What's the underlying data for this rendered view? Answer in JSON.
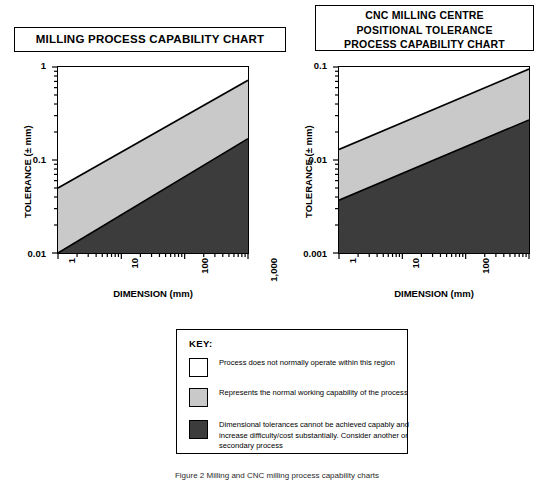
{
  "page": {
    "width": 544,
    "height": 482,
    "background": "#ffffff"
  },
  "colors": {
    "white_band": "#ffffff",
    "light_gray_band": "#c9c9c9",
    "dark_gray_band": "#3c3c3c",
    "line": "#000000"
  },
  "charts": [
    {
      "id": "milling-process-capability",
      "title_lines": [
        "MILLING PROCESS CAPABILITY CHART"
      ],
      "xlabel": "DIMENSION (mm)",
      "ylabel": "TOLERANCE (± mm)",
      "xticks": [
        "1",
        "10",
        "100",
        "1,000"
      ],
      "yticks": [
        "0.01",
        "0.1",
        "1"
      ]
    },
    {
      "id": "cnc-positional-tolerance",
      "title_lines": [
        "CNC MILLING CENTRE",
        "POSITIONAL TOLERANCE",
        "PROCESS CAPABILITY CHART"
      ],
      "xlabel": "DIMENSION (mm)",
      "ylabel": "TOLERANCE (± mm)",
      "xticks": [
        "1",
        "10",
        "100",
        "1,000"
      ],
      "yticks": [
        "0.001",
        "0.01",
        "0.1"
      ]
    }
  ],
  "key": {
    "title": "KEY:",
    "items": [
      {
        "swatch": "white",
        "color": "#ffffff",
        "text": "Process does not normally operate within this region"
      },
      {
        "swatch": "light-gray",
        "color": "#c9c9c9",
        "text": "Represents the normal working capability of the process"
      },
      {
        "swatch": "dark-gray",
        "color": "#3c3c3c",
        "text": "Dimensional tolerances cannot be achieved capably and increase difficulty/cost substantially. Consider another or secondary process"
      }
    ]
  },
  "caption": "Figure 2 Milling and CNC milling process capability charts",
  "chart_data": [
    {
      "type": "area",
      "id": "milling-process-capability",
      "title": "MILLING PROCESS CAPABILITY CHART",
      "xlabel": "DIMENSION (mm)",
      "ylabel": "TOLERANCE (± mm)",
      "xscale": "log",
      "yscale": "log",
      "xlim": [
        1,
        1000
      ],
      "ylim": [
        0.01,
        1
      ],
      "xticks": [
        1,
        10,
        100,
        1000
      ],
      "xticklabels": [
        "1",
        "10",
        "100",
        "1,000"
      ],
      "yticks": [
        0.01,
        0.1,
        1
      ],
      "yticklabels": [
        "0.01",
        "0.1",
        "1"
      ],
      "grid": false,
      "legend": "below, in KEY box",
      "series": [
        {
          "name": "upper boundary (white / normal-capability divide)",
          "x": [
            1,
            1000
          ],
          "y": [
            0.05,
            0.72
          ]
        },
        {
          "name": "lower boundary (normal-capability / not-capable divide)",
          "x": [
            1,
            1000
          ],
          "y": [
            0.01,
            0.17
          ]
        }
      ],
      "bands": [
        {
          "name": "Process does not normally operate within this region",
          "fill": "#ffffff",
          "region": "above upper boundary"
        },
        {
          "name": "Represents the normal working capability of the process",
          "fill": "#c9c9c9",
          "region": "between boundaries"
        },
        {
          "name": "Dimensional tolerances cannot be achieved capably",
          "fill": "#3c3c3c",
          "region": "below lower boundary"
        }
      ]
    },
    {
      "type": "area",
      "id": "cnc-positional-tolerance",
      "title": "CNC MILLING CENTRE POSITIONAL TOLERANCE PROCESS CAPABILITY CHART",
      "xlabel": "DIMENSION (mm)",
      "ylabel": "TOLERANCE (± mm)",
      "xscale": "log",
      "yscale": "log",
      "xlim": [
        1,
        1000
      ],
      "ylim": [
        0.001,
        0.1
      ],
      "xticks": [
        1,
        10,
        100,
        1000
      ],
      "xticklabels": [
        "1",
        "10",
        "100",
        "1,000"
      ],
      "yticks": [
        0.001,
        0.01,
        0.1
      ],
      "yticklabels": [
        "0.001",
        "0.01",
        "0.1"
      ],
      "grid": false,
      "legend": "below, in KEY box",
      "series": [
        {
          "name": "upper boundary (white / normal-capability divide)",
          "x": [
            1,
            1000
          ],
          "y": [
            0.013,
            0.095
          ]
        },
        {
          "name": "lower boundary (normal-capability / not-capable divide)",
          "x": [
            1,
            1000
          ],
          "y": [
            0.0037,
            0.027
          ]
        }
      ],
      "bands": [
        {
          "name": "Process does not normally operate within this region",
          "fill": "#ffffff",
          "region": "above upper boundary"
        },
        {
          "name": "Represents the normal working capability of the process",
          "fill": "#c9c9c9",
          "region": "between boundaries"
        },
        {
          "name": "Dimensional tolerances cannot be achieved capably",
          "fill": "#3c3c3c",
          "region": "below lower boundary"
        }
      ]
    }
  ]
}
